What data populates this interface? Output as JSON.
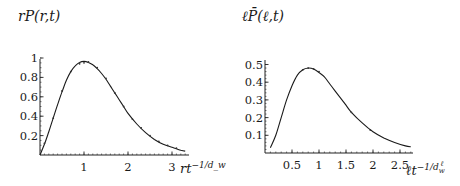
{
  "chart_data": [
    {
      "type": "line",
      "title": "",
      "ylabel": "rP(r,t)",
      "xlabel": "rt^{-1/d_w}",
      "xlabel_base": "rt",
      "xlabel_exp": "−1/d_w",
      "xlim": [
        0,
        3.35
      ],
      "ylim": [
        0,
        1.0
      ],
      "xticks": [
        1,
        2,
        3
      ],
      "xtick_labels": [
        "1",
        "2",
        "3"
      ],
      "yticks": [
        0.2,
        0.4,
        0.6,
        0.8,
        1.0
      ],
      "ytick_labels": [
        "0.2",
        "0.4",
        "0.6",
        "0.8",
        "1"
      ],
      "grid": false,
      "legend": null,
      "series": [
        {
          "name": "scaling function (solid)",
          "style": "solid",
          "x": [
            0.0,
            0.1,
            0.2,
            0.3,
            0.4,
            0.5,
            0.6,
            0.7,
            0.8,
            0.9,
            1.0,
            1.1,
            1.2,
            1.3,
            1.4,
            1.5,
            1.6,
            1.7,
            1.8,
            1.9,
            2.0,
            2.2,
            2.4,
            2.6,
            2.8,
            3.0,
            3.2,
            3.3
          ],
          "y": [
            0.0,
            0.11,
            0.24,
            0.38,
            0.52,
            0.65,
            0.77,
            0.86,
            0.92,
            0.955,
            0.965,
            0.955,
            0.93,
            0.89,
            0.84,
            0.78,
            0.71,
            0.64,
            0.57,
            0.5,
            0.43,
            0.32,
            0.23,
            0.16,
            0.11,
            0.08,
            0.05,
            0.04
          ]
        },
        {
          "name": "simulation data (points)",
          "style": "dotted",
          "x": [
            0.1,
            0.3,
            0.5,
            0.7,
            0.9,
            1.0,
            1.1,
            1.3,
            1.5,
            1.7,
            1.9,
            2.1,
            2.3,
            2.5,
            2.7,
            2.9,
            3.1
          ],
          "y": [
            0.12,
            0.38,
            0.66,
            0.86,
            0.94,
            0.95,
            0.96,
            0.9,
            0.79,
            0.64,
            0.5,
            0.37,
            0.28,
            0.2,
            0.14,
            0.1,
            0.07
          ]
        }
      ]
    },
    {
      "type": "line",
      "title": "",
      "ylabel": "ℓP̄(ℓ,t)",
      "xlabel": "ℓt^{-1/d_w^ℓ}",
      "xlabel_base": "ℓt",
      "xlabel_exp": "−1/d",
      "xlabel_exp_sub": "w",
      "xlabel_exp_sup": "ℓ",
      "xlim": [
        0,
        2.75
      ],
      "ylim": [
        0,
        0.5
      ],
      "xticks": [
        0.5,
        1,
        1.5,
        2,
        2.5
      ],
      "xtick_labels": [
        "0.5",
        "1",
        "1.5",
        "2",
        "2.5"
      ],
      "yticks": [
        0.1,
        0.2,
        0.3,
        0.4,
        0.5
      ],
      "ytick_labels": [
        "0.1",
        "0.2",
        "0.3",
        "0.4",
        "0.5"
      ],
      "grid": false,
      "legend": null,
      "series": [
        {
          "name": "scaling function (solid)",
          "style": "solid",
          "x": [
            0.1,
            0.2,
            0.3,
            0.4,
            0.5,
            0.6,
            0.7,
            0.8,
            0.9,
            1.0,
            1.1,
            1.2,
            1.3,
            1.4,
            1.5,
            1.6,
            1.8,
            2.0,
            2.2,
            2.4,
            2.6,
            2.7
          ],
          "y": [
            0.03,
            0.1,
            0.2,
            0.3,
            0.38,
            0.44,
            0.47,
            0.48,
            0.475,
            0.455,
            0.43,
            0.39,
            0.35,
            0.31,
            0.27,
            0.23,
            0.17,
            0.12,
            0.085,
            0.06,
            0.04,
            0.035
          ]
        },
        {
          "name": "simulation data (points)",
          "style": "dotted",
          "x": [
            0.7,
            0.8,
            0.9,
            1.0,
            1.6,
            1.95
          ],
          "y": [
            0.47,
            0.48,
            0.475,
            0.46,
            0.23,
            0.13
          ]
        }
      ]
    }
  ]
}
